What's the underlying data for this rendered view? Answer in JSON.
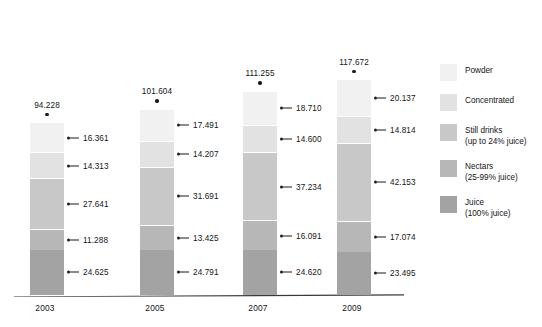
{
  "chart_data": {
    "type": "bar",
    "subtype": "stacked-bar",
    "title": "",
    "subtitle": "",
    "xlabel": "",
    "ylabel": "",
    "grid": false,
    "legend_position": "right",
    "axis_visible": {
      "x": true,
      "y": false
    },
    "categories": [
      "2003",
      "2005",
      "2007",
      "2009"
    ],
    "totals": [
      "94.228",
      "101.604",
      "111.255",
      "117.672"
    ],
    "totals_numeric": [
      94.228,
      101.604,
      111.255,
      117.672
    ],
    "ylim": [
      0,
      117.672
    ],
    "stack_order_bottom_to_top": [
      "Juice",
      "Nectars",
      "Still drinks",
      "Concentrated",
      "Powder"
    ],
    "series": [
      {
        "name": "Juice",
        "sublabel": "(100% juice)",
        "color": "#a3a3a3",
        "values": [
          24.625,
          24.791,
          24.62,
          23.495
        ],
        "labels": [
          "24.625",
          "24.791",
          "24.620",
          "23.495"
        ]
      },
      {
        "name": "Nectars",
        "sublabel": "(25-99% juice)",
        "color": "#b7b7b7",
        "values": [
          11.288,
          13.425,
          16.091,
          17.074
        ],
        "labels": [
          "11.288",
          "13.425",
          "16.091",
          "17.074"
        ]
      },
      {
        "name": "Still drinks",
        "sublabel": "(up to 24% juice)",
        "color": "#c8c8c8",
        "values": [
          27.641,
          31.691,
          37.234,
          42.153
        ],
        "labels": [
          "27.641",
          "31.691",
          "37.234",
          "42.153"
        ]
      },
      {
        "name": "Concentrated",
        "sublabel": "",
        "color": "#e2e2e2",
        "values": [
          14.313,
          14.207,
          14.6,
          14.814
        ],
        "labels": [
          "14.313",
          "14.207",
          "14.600",
          "14.814"
        ]
      },
      {
        "name": "Powder",
        "sublabel": "",
        "color": "#f1f1f1",
        "values": [
          16.361,
          17.491,
          18.71,
          20.137
        ],
        "labels": [
          "16.361",
          "17.491",
          "18.710",
          "20.137"
        ]
      }
    ],
    "legend": [
      {
        "label": "Powder",
        "sublabel": "",
        "color": "#f1f1f1"
      },
      {
        "label": "Concentrated",
        "sublabel": "",
        "color": "#e2e2e2"
      },
      {
        "label": "Still drinks",
        "sublabel": "(up to 24% juice)",
        "color": "#c8c8c8"
      },
      {
        "label": "Nectars",
        "sublabel": "(25-99% juice)",
        "color": "#b7b7b7"
      },
      {
        "label": "Juice",
        "sublabel": "(100% juice)",
        "color": "#a3a3a3"
      }
    ]
  },
  "colors": {
    "background": "#ffffff",
    "text": "#141414",
    "axis": "#3a3a3a",
    "leader": "#1a1a1a",
    "segment_gap": "#ffffff"
  }
}
